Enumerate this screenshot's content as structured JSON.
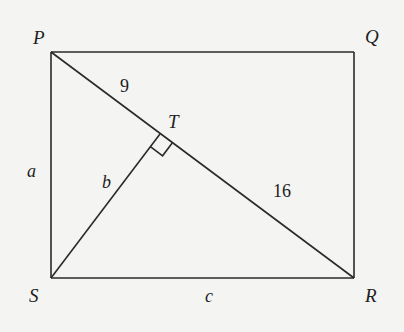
{
  "figure": {
    "vertices": {
      "P": {
        "label": "P",
        "x": 51,
        "y": 52
      },
      "Q": {
        "label": "Q",
        "x": 354,
        "y": 52
      },
      "R": {
        "label": "R",
        "x": 354,
        "y": 278
      },
      "S": {
        "label": "S",
        "x": 51,
        "y": 278
      },
      "T": {
        "label": "T",
        "x": 160,
        "y": 134
      }
    },
    "segments": [
      {
        "from": "P",
        "to": "Q",
        "label": ""
      },
      {
        "from": "Q",
        "to": "R",
        "label": ""
      },
      {
        "from": "R",
        "to": "S",
        "label": "c"
      },
      {
        "from": "S",
        "to": "P",
        "label": "a"
      },
      {
        "from": "P",
        "to": "R",
        "label": ""
      },
      {
        "from": "S",
        "to": "T",
        "label": "b"
      }
    ],
    "lengths": {
      "PT": "9",
      "TR": "16"
    },
    "side_labels": {
      "a": "a",
      "b": "b",
      "c": "c"
    },
    "right_angle_at": "T",
    "stroke_color": "#2a2a2a",
    "background_color": "#f4f4f2"
  }
}
